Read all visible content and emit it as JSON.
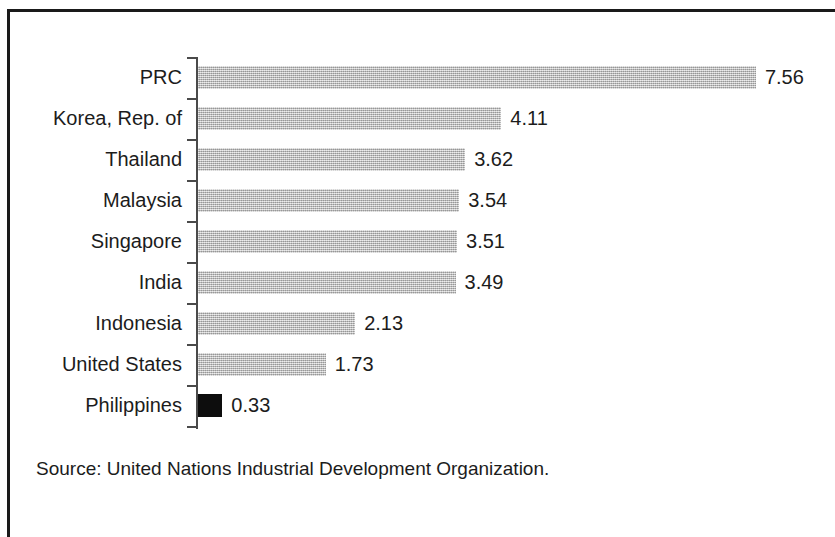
{
  "figure": {
    "width": 835,
    "height": 537,
    "frame_color": "#1a1a1a",
    "background": "#ffffff"
  },
  "source_note": "Source:  United Nations Industrial Development Organization.",
  "chart_data": {
    "type": "bar",
    "orientation": "horizontal",
    "title": "",
    "subtitle": "",
    "xlabel": "",
    "ylabel": "",
    "grid": false,
    "legend": null,
    "axis": {
      "category_axis": "vertical-left",
      "value_axis_visible": false,
      "tick_marks": "between-categories",
      "xlim": [
        0,
        7.56
      ],
      "origin_px": 197,
      "px_per_unit": 73.8
    },
    "categories": [
      "PRC",
      "Korea, Rep. of",
      "Thailand",
      "Malaysia",
      "Singapore",
      "India",
      "Indonesia",
      "United States",
      "Philippines"
    ],
    "values": [
      7.56,
      4.11,
      3.62,
      3.54,
      3.51,
      3.49,
      2.13,
      1.73,
      0.33
    ],
    "value_labels": [
      "7.56",
      "4.11",
      "3.62",
      "3.54",
      "3.51",
      "3.49",
      "2.13",
      "1.73",
      "0.33"
    ],
    "bar_colors": [
      "#b4b4b4",
      "#b4b4b4",
      "#b4b4b4",
      "#b4b4b4",
      "#b4b4b4",
      "#b4b4b4",
      "#b4b4b4",
      "#b4b4b4",
      "#0d0d0d"
    ],
    "highlighted_category": "Philippines",
    "source": "United Nations Industrial Development Organization."
  }
}
